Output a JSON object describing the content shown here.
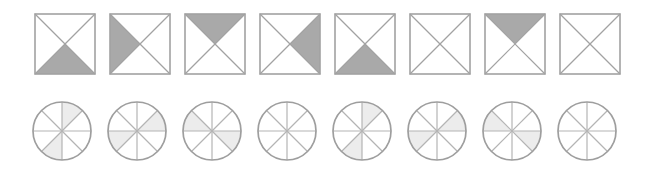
{
  "figure": {
    "background_color": "#ffffff",
    "rows": [
      {
        "row_name": "squares-row",
        "shape_type": "square",
        "segment_count": 4,
        "segment_labels": [
          "top",
          "right",
          "bottom",
          "left"
        ],
        "stroke_color": "#a2a2a2",
        "fill_color": "#a9a9a9",
        "empty_color": "#ffffff",
        "stroke_width": 1.2,
        "items": [
          {
            "index": 1,
            "name": "square-1",
            "filled_segments": [
              "bottom"
            ],
            "filled_count": 1
          },
          {
            "index": 2,
            "name": "square-2",
            "filled_segments": [
              "left"
            ],
            "filled_count": 1
          },
          {
            "index": 3,
            "name": "square-3",
            "filled_segments": [
              "top"
            ],
            "filled_count": 1
          },
          {
            "index": 4,
            "name": "square-4",
            "filled_segments": [
              "right"
            ],
            "filled_count": 1
          },
          {
            "index": 5,
            "name": "square-5",
            "filled_segments": [
              "bottom"
            ],
            "filled_count": 1
          },
          {
            "index": 6,
            "name": "square-6",
            "filled_segments": [],
            "filled_count": 0
          },
          {
            "index": 7,
            "name": "square-7",
            "filled_segments": [
              "top"
            ],
            "filled_count": 1
          },
          {
            "index": 8,
            "name": "square-8",
            "filled_segments": [],
            "filled_count": 0
          }
        ]
      },
      {
        "row_name": "circles-row",
        "shape_type": "circle",
        "segment_count": 8,
        "segment_labels": [
          "s0",
          "s1",
          "s2",
          "s3",
          "s4",
          "s5",
          "s6",
          "s7"
        ],
        "segment_start_angle_deg": -90,
        "stroke_color": "#9e9e9e",
        "spoke_color": "#b4b4b4",
        "fill_color": "#ececec",
        "empty_color": "#ffffff",
        "stroke_width": 1.2,
        "items": [
          {
            "index": 1,
            "name": "circle-1",
            "filled_segments": [
              0,
              4
            ],
            "filled_count": 2
          },
          {
            "index": 2,
            "name": "circle-2",
            "filled_segments": [
              1,
              5
            ],
            "filled_count": 2
          },
          {
            "index": 3,
            "name": "circle-3",
            "filled_segments": [
              2,
              6
            ],
            "filled_count": 2
          },
          {
            "index": 4,
            "name": "circle-4",
            "filled_segments": [],
            "filled_count": 0
          },
          {
            "index": 5,
            "name": "circle-5",
            "filled_segments": [
              0,
              4
            ],
            "filled_count": 2
          },
          {
            "index": 6,
            "name": "circle-6",
            "filled_segments": [
              1,
              5
            ],
            "filled_count": 2
          },
          {
            "index": 7,
            "name": "circle-7",
            "filled_segments": [
              2,
              6
            ],
            "filled_count": 2
          },
          {
            "index": 8,
            "name": "circle-8",
            "filled_segments": [],
            "filled_count": 0
          }
        ]
      }
    ]
  }
}
